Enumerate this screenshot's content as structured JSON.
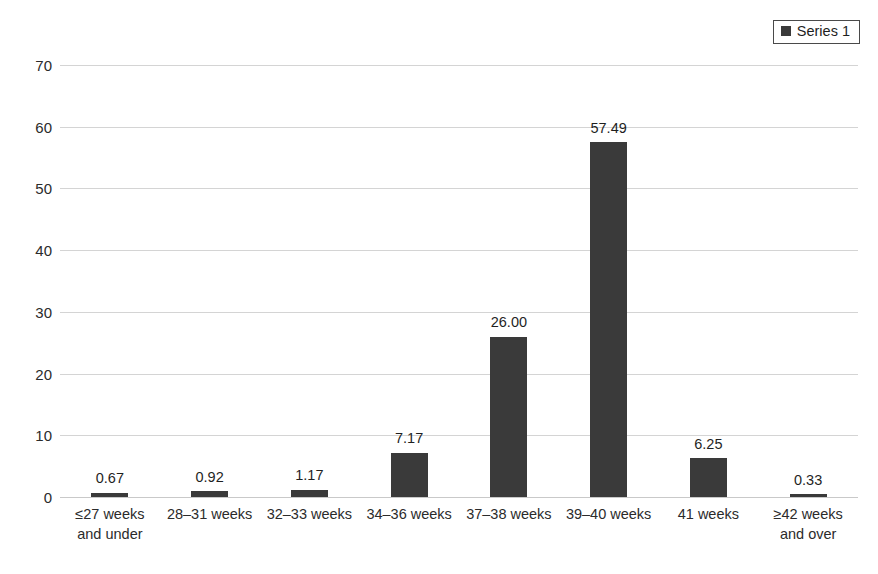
{
  "legend": {
    "entries": [
      {
        "label": "Series 1",
        "color": "#3a3a3a",
        "marker": "square-marker-icon"
      }
    ],
    "position": "top-right",
    "bordered": true
  },
  "axes": {
    "y_ticks": [
      "0",
      "10",
      "20",
      "30",
      "40",
      "50",
      "60",
      "70"
    ],
    "x_labels": [
      "≤27 weeks and under",
      "28–31 weeks",
      "32–33 weeks",
      "34–36 weeks",
      "37–38 weeks",
      "39–40 weeks",
      "41 weeks",
      "≥42 weeks and over"
    ]
  },
  "chart_data": {
    "type": "bar",
    "title": "",
    "xlabel": "",
    "ylabel": "",
    "ylim": [
      0,
      70
    ],
    "ytick_step": 10,
    "grid": true,
    "legend_position": "top-right",
    "bar_color": "#3a3a3a",
    "gridline_color": "#d4d4d4",
    "categories": [
      "≤27 weeks and under",
      "28–31 weeks",
      "32–33 weeks",
      "34–36 weeks",
      "37–38 weeks",
      "39–40 weeks",
      "41 weeks",
      "≥42 weeks and over"
    ],
    "series": [
      {
        "name": "Series 1",
        "values": [
          0.67,
          0.92,
          1.17,
          7.17,
          26.0,
          57.49,
          6.25,
          0.33
        ],
        "data_labels": [
          "0.67",
          "0.92",
          "1.17",
          "7.17",
          "26.00",
          "57.49",
          "6.25",
          "0.33"
        ]
      }
    ]
  }
}
